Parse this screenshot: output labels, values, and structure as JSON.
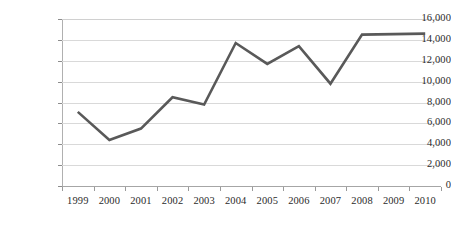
{
  "chart_data": {
    "type": "line",
    "title": "",
    "subtitle": "",
    "xlabel": "",
    "ylabel": "",
    "categories": [
      "1999",
      "2000",
      "2001",
      "2002",
      "2003",
      "2004",
      "2005",
      "2006",
      "2007",
      "2008",
      "2009",
      "2010"
    ],
    "series": [
      {
        "name": "series-1",
        "color": "#595959",
        "values": [
          7100,
          4400,
          5500,
          8500,
          7800,
          13700,
          11700,
          13400,
          9800,
          14500,
          14550,
          14600
        ]
      }
    ],
    "ylim": [
      0,
      16000
    ],
    "ytick_values": [
      0,
      2000,
      4000,
      6000,
      8000,
      10000,
      12000,
      14000,
      16000
    ],
    "ytick_labels": [
      "0",
      "2,000",
      "4,000",
      "6,000",
      "8,000",
      "10,000",
      "12,000",
      "14,000",
      "16,000"
    ],
    "grid": "horizontal",
    "legend": "none",
    "background_color": "#ffffff",
    "axis_color": "#b0b0b0",
    "gridline_color": "#d9d9d9",
    "label_color": "#2b2b2b"
  }
}
